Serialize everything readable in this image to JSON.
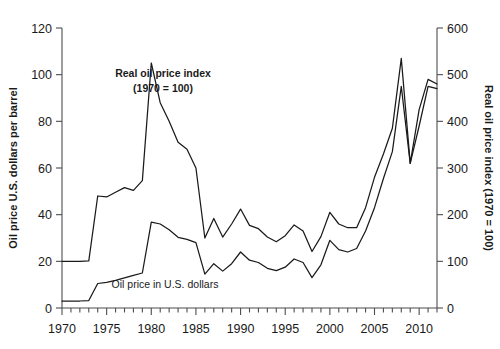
{
  "chart_data": {
    "type": "line",
    "title": "",
    "subtitle": "",
    "xlabel": "",
    "ylabel": "Oil price U.S. dollars per barrel",
    "y2label": "Real oil price index (1970 = 100)",
    "xlim": [
      1970,
      2012
    ],
    "ylim": [
      0,
      120
    ],
    "y2lim": [
      0,
      600
    ],
    "grid": false,
    "legend_position": "inline-annotation",
    "xticks": [
      1970,
      1975,
      1980,
      1985,
      1990,
      1995,
      2000,
      2005,
      2010
    ],
    "xtick_labels": [
      "1970",
      "1975",
      "1980",
      "1985",
      "1990",
      "1995",
      "2000",
      "2005",
      "2010"
    ],
    "x_minor_tick_interval": 1,
    "yticks": [
      0,
      20,
      40,
      60,
      80,
      100,
      120
    ],
    "ytick_labels": [
      "0",
      "20",
      "40",
      "60",
      "80",
      "100",
      "120"
    ],
    "y2ticks": [
      0,
      100,
      200,
      300,
      400,
      500,
      600
    ],
    "y2tick_labels": [
      "0",
      "100",
      "200",
      "300",
      "400",
      "500",
      "600"
    ],
    "x": [
      1970,
      1971,
      1972,
      1973,
      1974,
      1975,
      1976,
      1977,
      1978,
      1979,
      1980,
      1981,
      1982,
      1983,
      1984,
      1985,
      1986,
      1987,
      1988,
      1989,
      1990,
      1991,
      1992,
      1993,
      1994,
      1995,
      1996,
      1997,
      1998,
      1999,
      2000,
      2001,
      2002,
      2003,
      2004,
      2005,
      2006,
      2007,
      2008,
      2009,
      2010,
      2011,
      2012
    ],
    "series": [
      {
        "name": "Real oil price index (1970 = 100)",
        "axis": "right",
        "units": "index, 1970 = 100",
        "values": [
          100,
          100,
          100,
          101,
          240,
          238,
          248,
          258,
          252,
          273,
          525,
          440,
          400,
          355,
          340,
          300,
          150,
          192,
          152,
          180,
          212,
          177,
          170,
          152,
          142,
          155,
          178,
          165,
          121,
          153,
          205,
          180,
          172,
          172,
          215,
          280,
          330,
          385,
          535,
          310,
          425,
          490,
          480
        ],
        "left_axis_equivalent": [
          20.0,
          20.0,
          20.0,
          20.2,
          48.0,
          47.6,
          49.6,
          51.6,
          50.4,
          54.6,
          105.0,
          88.0,
          80.0,
          71.0,
          68.0,
          60.0,
          30.0,
          38.4,
          30.4,
          36.0,
          42.4,
          35.4,
          34.0,
          30.4,
          28.4,
          31.0,
          35.6,
          33.0,
          24.2,
          30.6,
          41.0,
          36.0,
          34.4,
          34.4,
          43.0,
          56.0,
          66.0,
          77.0,
          107.0,
          62.0,
          85.0,
          98.0,
          96.0
        ]
      },
      {
        "name": "Oil price in U.S. dollars",
        "axis": "left",
        "units": "U.S. dollars per barrel",
        "values": [
          3.0,
          3.0,
          3.0,
          3.2,
          10.5,
          11.0,
          11.8,
          12.9,
          14.0,
          15.0,
          36.8,
          36.0,
          33.5,
          30.3,
          29.4,
          28.0,
          14.5,
          19.0,
          15.8,
          19.0,
          24.0,
          20.5,
          19.5,
          17.0,
          16.0,
          17.5,
          21.0,
          19.5,
          13.0,
          18.5,
          29.0,
          25.0,
          24.0,
          25.5,
          33.0,
          43.0,
          55.5,
          67.0,
          95.0,
          62.0,
          78.0,
          95.0,
          94.0
        ]
      }
    ],
    "annotations": [
      {
        "id": "real-index-annotation",
        "line1": "Real oil price index",
        "line2": "(1970 = 100)",
        "style": "bold",
        "x_px": 163,
        "y_px": 77
      },
      {
        "id": "nominal-price-annotation",
        "line1": "Oil price in U.S. dollars",
        "line2": "",
        "style": "plain",
        "x_px": 165,
        "y_px": 288
      }
    ],
    "colors": {
      "series_line": "#1a1a1a",
      "axis": "#4d4d4d",
      "background": "#ffffff",
      "text": "#1a1a1a"
    }
  }
}
